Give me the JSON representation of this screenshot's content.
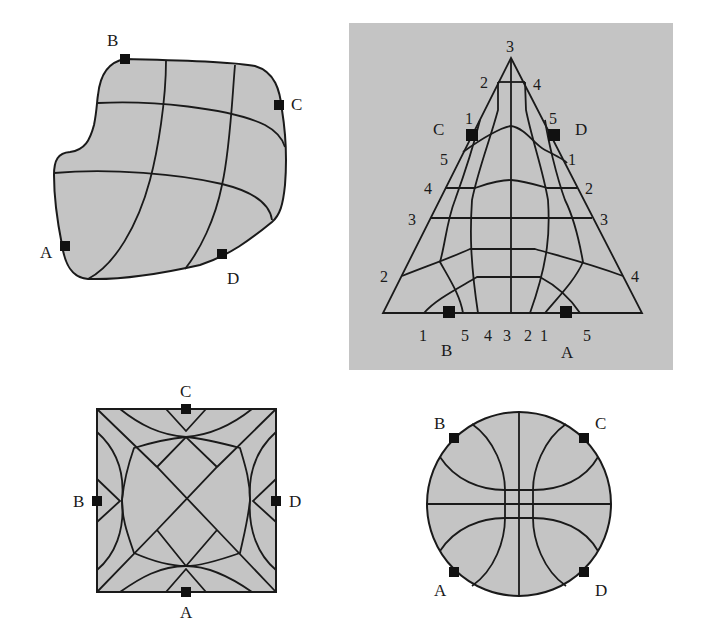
{
  "figure": {
    "panels": [
      {
        "id": "blob",
        "shape": "irregular region",
        "markers": [
          {
            "label": "A"
          },
          {
            "label": "B"
          },
          {
            "label": "C"
          },
          {
            "label": "D"
          }
        ]
      },
      {
        "id": "triangle",
        "shape": "triangle",
        "background": "#c4c4c4",
        "markers": [
          {
            "label": "C"
          },
          {
            "label": "D"
          },
          {
            "label": "B"
          },
          {
            "label": "A"
          }
        ],
        "left_edge_numbers": [
          "2",
          "1",
          "5",
          "4",
          "3",
          "2"
        ],
        "right_edge_numbers": [
          "4",
          "5",
          "1",
          "2",
          "3",
          "4"
        ],
        "apex_number": "3",
        "bottom_numbers": [
          "1",
          "5",
          "4",
          "3",
          "2",
          "1",
          "5"
        ]
      },
      {
        "id": "square",
        "shape": "square",
        "markers": [
          {
            "label": "C"
          },
          {
            "label": "B"
          },
          {
            "label": "D"
          },
          {
            "label": "A"
          }
        ]
      },
      {
        "id": "disk",
        "shape": "circle",
        "markers": [
          {
            "label": "B"
          },
          {
            "label": "C"
          },
          {
            "label": "A"
          },
          {
            "label": "D"
          }
        ]
      }
    ],
    "colors": {
      "fill": "#c4c4c4",
      "stroke": "#1a1a1a",
      "marker": "#111111"
    }
  }
}
